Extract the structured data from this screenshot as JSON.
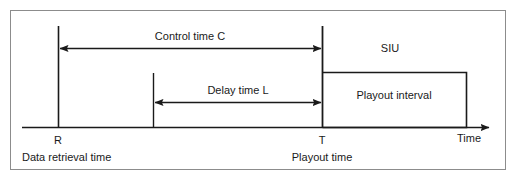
{
  "figure": {
    "type": "timing-diagram",
    "title": "",
    "background_color": "#ffffff",
    "line_color": "#1a1a1a",
    "frame_color": "#8c8c8c",
    "axis": {
      "label": "Time",
      "direction": "left-to-right",
      "has_arrowhead": true
    },
    "events": [
      {
        "key": "R",
        "marker_label": "R",
        "description": "Data retrieval time"
      },
      {
        "key": "T",
        "marker_label": "T",
        "description": "Playout time"
      }
    ],
    "intervals": [
      {
        "key": "control_time",
        "label": "Control time C",
        "from": "R",
        "to": "T",
        "arrow_style": "double-headed"
      },
      {
        "key": "delay_time",
        "label": "Delay time L",
        "from": "delay_start",
        "to": "T",
        "arrow_style": "double-headed"
      }
    ],
    "regions": [
      {
        "key": "siu",
        "label": "SIU"
      },
      {
        "key": "playout_interval",
        "label": "Playout interval"
      }
    ]
  }
}
